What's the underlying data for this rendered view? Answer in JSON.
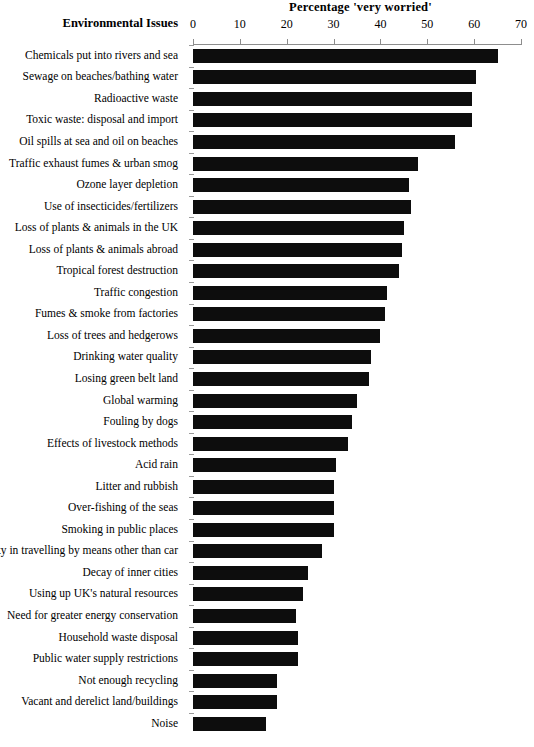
{
  "chart_data": {
    "type": "bar",
    "orientation": "horizontal",
    "title": "Percentage 'very worried'",
    "xlabel": "Percentage 'very worried'",
    "ylabel": "Environmental Issues",
    "xlim": [
      0,
      70
    ],
    "xticks": [
      0,
      10,
      20,
      30,
      40,
      50,
      60,
      70
    ],
    "grid": false,
    "legend": "none",
    "bar_color": "#0d0d0d",
    "axis_color": "#8d8d8d",
    "categories": [
      "Chemicals put into rivers and sea",
      "Sewage on beaches/bathing water",
      "Radioactive waste",
      "Toxic waste: disposal and import",
      "Oil spills at sea and oil on beaches",
      "Traffic exhaust fumes & urban smog",
      "Ozone layer depletion",
      "Use of insecticides/fertilizers",
      "Loss of plants & animals in the UK",
      "Loss of plants & animals abroad",
      "Tropical forest destruction",
      "Traffic congestion",
      "Fumes & smoke from factories",
      "Loss of trees and hedgerows",
      "Drinking water quality",
      "Losing green belt land",
      "Global warming",
      "Fouling by dogs",
      "Effects of livestock methods",
      "Acid rain",
      "Litter and rubbish",
      "Over-fishing of the seas",
      "Smoking in public places",
      "Difficulty in travelling by means other than car",
      "Decay of inner cities",
      "Using up UK's natural resources",
      "Need for greater energy conservation",
      "Household waste disposal",
      "Public water supply restrictions",
      "Not enough recycling",
      "Vacant and derelict land/buildings",
      "Noise"
    ],
    "values": [
      65,
      60.5,
      59.5,
      59.5,
      56,
      48,
      46,
      46.5,
      45,
      44.5,
      44,
      41.5,
      41,
      40,
      38,
      37.5,
      35,
      34,
      33,
      30.5,
      30,
      30,
      30,
      27.5,
      24.5,
      23.5,
      22,
      22.5,
      22.5,
      18,
      18,
      15.5
    ]
  }
}
